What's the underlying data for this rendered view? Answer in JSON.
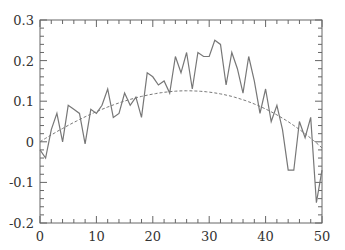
{
  "chart_data": {
    "type": "line",
    "title": "",
    "xlabel": "",
    "ylabel": "",
    "xlim": [
      0,
      50
    ],
    "ylim": [
      -0.2,
      0.3
    ],
    "grid": false,
    "legend": null,
    "x_ticks": [
      "0",
      "10",
      "20",
      "30",
      "40",
      "50"
    ],
    "y_ticks": [
      "-0.2",
      "-0.1",
      "0",
      "0.1",
      "0.2",
      "0.3"
    ],
    "series": [
      {
        "name": "noisy data",
        "style": "solid",
        "color": "#777777",
        "x": [
          0,
          1,
          2,
          3,
          4,
          5,
          6,
          7,
          8,
          9,
          10,
          11,
          12,
          13,
          14,
          15,
          16,
          17,
          18,
          19,
          20,
          21,
          22,
          23,
          24,
          25,
          26,
          27,
          28,
          29,
          30,
          31,
          32,
          33,
          34,
          35,
          36,
          37,
          38,
          39,
          40,
          41,
          42,
          43,
          44,
          45,
          46,
          47,
          48,
          49,
          50
        ],
        "values": [
          -0.02,
          -0.04,
          0.03,
          0.07,
          0.0,
          0.09,
          0.08,
          0.07,
          -0.005,
          0.08,
          0.07,
          0.09,
          0.13,
          0.06,
          0.07,
          0.12,
          0.09,
          0.11,
          0.06,
          0.17,
          0.16,
          0.14,
          0.15,
          0.12,
          0.21,
          0.17,
          0.22,
          0.13,
          0.22,
          0.21,
          0.21,
          0.25,
          0.24,
          0.14,
          0.22,
          0.18,
          0.12,
          0.21,
          0.15,
          0.07,
          0.13,
          0.05,
          0.09,
          0.03,
          -0.07,
          -0.07,
          0.05,
          0.01,
          0.06,
          -0.15,
          -0.07
        ]
      },
      {
        "name": "fit",
        "style": "dashed",
        "color": "#777777",
        "x": [
          0,
          5,
          10,
          15,
          20,
          25,
          30,
          35,
          40,
          45,
          50
        ],
        "values": [
          0.0,
          0.035,
          0.075,
          0.11,
          0.14,
          0.158,
          0.16,
          0.14,
          0.09,
          0.01,
          -0.1
        ]
      }
    ]
  }
}
